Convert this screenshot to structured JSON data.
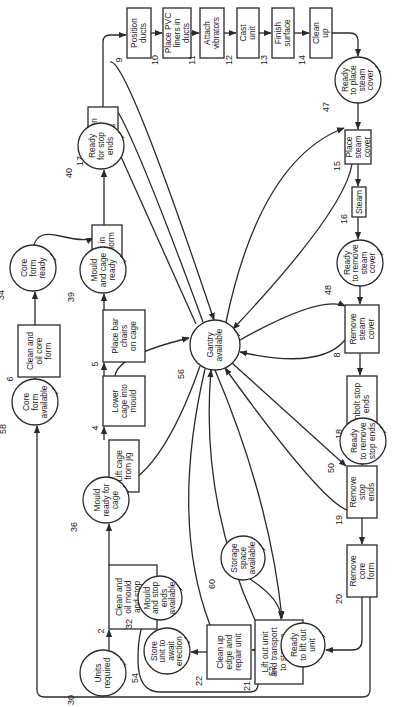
{
  "diagram": {
    "type": "activity-resource network (rotated 90°)",
    "color_line": "#2a2a2a",
    "color_background": "#ffffff",
    "activities": [
      {
        "id": "2",
        "lines": [
          "Clean and",
          "oil mould",
          "and stop",
          "ends"
        ],
        "x": 109,
        "y": 565,
        "w": 48,
        "h": 64
      },
      {
        "id": "3",
        "lines": [
          "Lift cage",
          "from jig"
        ],
        "x": 109,
        "y": 440,
        "w": 30,
        "h": 52
      },
      {
        "id": "4",
        "lines": [
          "Lower",
          "cage into",
          "mould"
        ],
        "x": 103,
        "y": 376,
        "w": 42,
        "h": 50
      },
      {
        "id": "5",
        "lines": [
          "Place bar",
          "chairs",
          "on cage"
        ],
        "x": 103,
        "y": 310,
        "w": 42,
        "h": 52
      },
      {
        "id": "6",
        "lines": [
          "Clean and",
          "oil core",
          "form"
        ],
        "x": 18,
        "y": 325,
        "w": 42,
        "h": 52
      },
      {
        "id": "7",
        "lines": [
          "Jack in",
          "core form"
        ],
        "x": 92,
        "y": 225,
        "w": 30,
        "h": 50
      },
      {
        "id": "17",
        "lines": [
          "Position",
          "stop",
          "ends"
        ],
        "x": 88,
        "y": 107,
        "w": 30,
        "h": 52
      },
      {
        "id": "9",
        "lines": [
          "Position",
          "ducts"
        ],
        "x": 127,
        "y": 8,
        "w": 24,
        "h": 50
      },
      {
        "id": "10",
        "lines": [
          "Place PVC",
          "liners in",
          "ducts"
        ],
        "x": 163,
        "y": 8,
        "w": 28,
        "h": 50
      },
      {
        "id": "11",
        "lines": [
          "Attach",
          "vibrators"
        ],
        "x": 200,
        "y": 8,
        "w": 24,
        "h": 50
      },
      {
        "id": "12",
        "lines": [
          "Cast",
          "unit"
        ],
        "x": 237,
        "y": 8,
        "w": 22,
        "h": 50
      },
      {
        "id": "13",
        "lines": [
          "Finish",
          "surface"
        ],
        "x": 272,
        "y": 8,
        "w": 22,
        "h": 50
      },
      {
        "id": "14",
        "lines": [
          "Clean",
          "up"
        ],
        "x": 310,
        "y": 8,
        "w": 22,
        "h": 50
      },
      {
        "id": "15",
        "lines": [
          "Place",
          "steam",
          "cover"
        ],
        "x": 345,
        "y": 130,
        "w": 26,
        "h": 34
      },
      {
        "id": "16",
        "lines": [
          "Steam"
        ],
        "x": 352,
        "y": 187,
        "w": 14,
        "h": 30
      },
      {
        "id": "8",
        "lines": [
          "Remove",
          "steam",
          "cover"
        ],
        "x": 345,
        "y": 305,
        "w": 34,
        "h": 48
      },
      {
        "id": "18",
        "lines": [
          "Unbolt stop",
          "ends"
        ],
        "x": 347,
        "y": 376,
        "w": 30,
        "h": 56
      },
      {
        "id": "19",
        "lines": [
          "Remove",
          "stop",
          "ends"
        ],
        "x": 347,
        "y": 466,
        "w": 30,
        "h": 52
      },
      {
        "id": "20",
        "lines": [
          "Remove",
          "core",
          "form"
        ],
        "x": 347,
        "y": 545,
        "w": 30,
        "h": 52
      },
      {
        "id": "21",
        "lines": [
          "Lift out unit",
          "and transport",
          "to storage",
          "yard"
        ],
        "x": 255,
        "y": 620,
        "w": 48,
        "h": 64
      },
      {
        "id": "22",
        "lines": [
          "Clean up",
          "edge and",
          "repair unit"
        ],
        "x": 207,
        "y": 625,
        "w": 44,
        "h": 54
      }
    ],
    "resources": [
      {
        "id": "30",
        "lines": [
          "Units",
          "required"
        ],
        "cx": 103,
        "cy": 673,
        "r": 23
      },
      {
        "id": "32",
        "lines": [
          "Mould",
          "and stop",
          "ends",
          "available"
        ],
        "cx": 160,
        "cy": 598,
        "r": 22
      },
      {
        "id": "36",
        "lines": [
          "Mould",
          "ready for",
          "cage"
        ],
        "cx": 106,
        "cy": 500,
        "r": 23
      },
      {
        "id": "39",
        "lines": [
          "Mould",
          "and cage",
          "ready"
        ],
        "cx": 103,
        "cy": 270,
        "r": 23
      },
      {
        "id": "34",
        "lines": [
          "Core",
          "form",
          "ready"
        ],
        "cx": 33,
        "cy": 268,
        "r": 23
      },
      {
        "id": "58",
        "lines": [
          "Core",
          "form",
          "available"
        ],
        "cx": 35,
        "cy": 402,
        "r": 23
      },
      {
        "id": "40",
        "lines": [
          "Ready",
          "for stop",
          "ends"
        ],
        "cx": 101,
        "cy": 146,
        "r": 23
      },
      {
        "id": "56",
        "lines": [
          "Gantry",
          "available"
        ],
        "cx": 215,
        "cy": 345,
        "r": 25
      },
      {
        "id": "47",
        "lines": [
          "Ready",
          "to place",
          "steam",
          "cover"
        ],
        "cx": 358,
        "cy": 80,
        "r": 23
      },
      {
        "id": "48",
        "lines": [
          "Ready",
          "to remove",
          "steam",
          "cover"
        ],
        "cx": 360,
        "cy": 263,
        "r": 23
      },
      {
        "id": "50",
        "lines": [
          "Ready",
          "to remove",
          "stop ends"
        ],
        "cx": 363,
        "cy": 441,
        "r": 23
      },
      {
        "id": "60",
        "lines": [
          "Storage",
          "space",
          "available"
        ],
        "cx": 243,
        "cy": 558,
        "r": 22
      },
      {
        "id": "52",
        "lines": [
          "Ready",
          "to lift out",
          "unit"
        ],
        "cx": 303,
        "cy": 645,
        "r": 22
      },
      {
        "id": "54",
        "lines": [
          "Store",
          "unit to",
          "await",
          "erection"
        ],
        "cx": 167,
        "cy": 651,
        "r": 23
      }
    ]
  }
}
